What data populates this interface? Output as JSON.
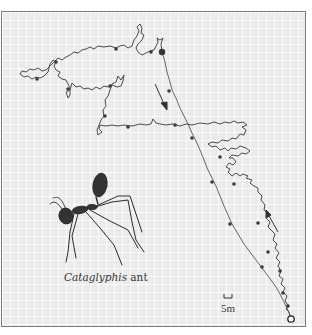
{
  "figure": {
    "caption_genus": "Cataglyphis",
    "caption_suffix": " ant",
    "scale_label": "5m",
    "colors": {
      "background": "#ebebeb",
      "grid": "#ffffff",
      "path": "#4a4a4a",
      "frame": "#7a7a7a"
    },
    "markers": {
      "nest": "open-circle",
      "turning_point": "large-filled-dot",
      "time_marks": "small-filled-dots"
    },
    "arrows": [
      {
        "label": "outbound-direction",
        "from": [
          155,
          84
        ],
        "to": [
          167,
          110
        ]
      },
      {
        "label": "homebound-direction",
        "from": [
          278,
          232
        ],
        "to": [
          266,
          211
        ]
      }
    ]
  }
}
